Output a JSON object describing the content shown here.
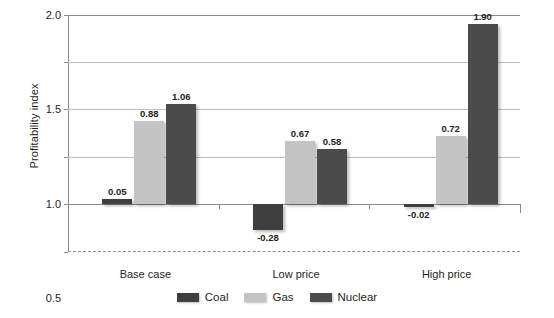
{
  "chart_data": {
    "type": "bar",
    "title": "",
    "xlabel": "",
    "ylabel": "Profitability index",
    "categories": [
      "Base case",
      "Low price",
      "High price"
    ],
    "series": [
      {
        "name": "Coal",
        "color": "#3f3f3f",
        "values": [
          0.05,
          -0.28,
          -0.02
        ]
      },
      {
        "name": "Gas",
        "color": "#c4c4c4",
        "values": [
          0.88,
          0.67,
          0.72
        ]
      },
      {
        "name": "Nuclear",
        "color": "#4b4b4b",
        "values": [
          1.06,
          0.58,
          1.9
        ]
      }
    ],
    "value_labels": [
      [
        "0.05",
        "-0.28",
        "-0.02"
      ],
      [
        "0.88",
        "0.67",
        "0.72"
      ],
      [
        "1.06",
        "0.58",
        "1.90"
      ]
    ],
    "ylim": [
      -0.5,
      2.0
    ],
    "yticks": [
      2.0,
      1.5,
      1.0,
      0.5,
      0,
      -0.5
    ],
    "ytick_labels": [
      "2.0",
      "1.5",
      "1.0",
      "0.5",
      "0",
      "-0.5"
    ],
    "grid": true,
    "legend_position": "bottom"
  },
  "legend": {
    "items": [
      {
        "label": "Coal"
      },
      {
        "label": "Gas"
      },
      {
        "label": "Nuclear"
      }
    ]
  }
}
